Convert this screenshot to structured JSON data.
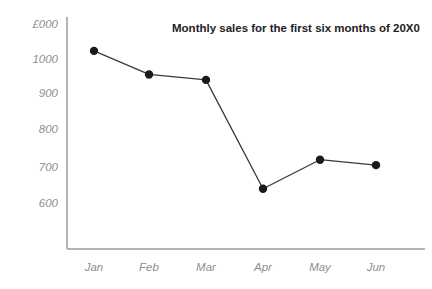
{
  "chart_data": {
    "type": "line",
    "title": "Monthly sales for the first six months of 20X0",
    "xlabel": "",
    "ylabel": "£000",
    "unit_label": "£000",
    "categories": [
      "Jan",
      "Feb",
      "Mar",
      "Apr",
      "May",
      "Jun"
    ],
    "values": [
      1025,
      960,
      945,
      645,
      725,
      710
    ],
    "series": [
      {
        "name": "Monthly sales",
        "values": [
          1025,
          960,
          945,
          645,
          725,
          710
        ]
      }
    ],
    "y_ticks": [
      "1000",
      "900",
      "800",
      "700",
      "600"
    ],
    "y_tick_values": [
      1000,
      900,
      800,
      700,
      600
    ],
    "ylim": [
      545,
      1055
    ],
    "grid": false,
    "legend": false,
    "legend_position": "none",
    "marker": "filled-circle",
    "line_color": "#3a3a3a",
    "marker_color": "#1a1a1a",
    "axis_color": "#b5b5b5",
    "label_color": "#8e8e8e",
    "title_color": "#1d1d1d",
    "background_color": "#ffffff"
  }
}
